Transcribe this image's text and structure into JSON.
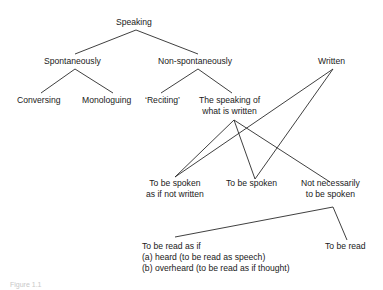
{
  "diagram": {
    "type": "tree",
    "nodes": {
      "speaking": "Speaking",
      "spontaneously": "Spontaneously",
      "non_spontaneously": "Non-spontaneously",
      "written": "Written",
      "conversing": "Conversing",
      "monologuing": "Monologuing",
      "reciting": "‘Reciting’",
      "speaking_written_1": "The speaking of",
      "speaking_written_2": "what is written",
      "spoken_not_written_1": "To be spoken",
      "spoken_not_written_2": "as if not written",
      "to_be_spoken": "To be spoken",
      "not_necessarily_1": "Not necessarily",
      "not_necessarily_2": "to be spoken",
      "read_as_if_1": "To be read as if",
      "read_as_if_2": "(a) heard (to be read as speech)",
      "read_as_if_3": "(b) overheard (to be read as if thought)",
      "to_be_read": "To be read"
    },
    "edges": [
      [
        "Speaking",
        "Spontaneously"
      ],
      [
        "Speaking",
        "Non-spontaneously"
      ],
      [
        "Spontaneously",
        "Conversing"
      ],
      [
        "Spontaneously",
        "Monologuing"
      ],
      [
        "Non-spontaneously",
        "‘Reciting’"
      ],
      [
        "Non-spontaneously",
        "The speaking of what is written"
      ],
      [
        "The speaking of what is written",
        "To be spoken as if not written"
      ],
      [
        "The speaking of what is written",
        "To be spoken"
      ],
      [
        "The speaking of what is written",
        "Not necessarily to be spoken"
      ],
      [
        "Written",
        "To be spoken as if not written"
      ],
      [
        "Written",
        "To be spoken"
      ],
      [
        "Not necessarily to be spoken",
        "To be read as if"
      ],
      [
        "Not necessarily to be spoken",
        "To be read"
      ]
    ],
    "caption": "Figure 1.1",
    "line_color": "#2a2a2a"
  }
}
